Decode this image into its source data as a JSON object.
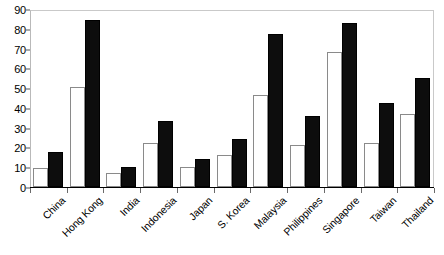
{
  "chart_data": {
    "type": "bar",
    "title": "",
    "subtitle": "",
    "xlabel": "",
    "ylabel": "",
    "ylim": [
      0,
      90
    ],
    "ytick_step": 10,
    "yticks": [
      0,
      10,
      20,
      30,
      40,
      50,
      60,
      70,
      80,
      90
    ],
    "ytick_labels": [
      "0",
      "10",
      "20",
      "30",
      "40",
      "50",
      "60",
      "70",
      "80",
      "90"
    ],
    "grid": false,
    "legend": "none",
    "legend_entries": [],
    "categories": [
      "China",
      "Hong Kong",
      "India",
      "Indonesia",
      "Japan",
      "S. Korea",
      "Malaysia",
      "Philippines",
      "Singapore",
      "Taiwan",
      "Thailand"
    ],
    "series": [
      {
        "name": "series-1",
        "fill": "white",
        "color": "#ffffff",
        "edge_color": "#8a8a8a",
        "values": [
          9.5,
          50.5,
          7.2,
          22.5,
          10.0,
          16.2,
          46.3,
          21.0,
          68.3,
          22.5,
          36.7
        ]
      },
      {
        "name": "series-2",
        "fill": "black",
        "color": "#0d0d0d",
        "edge_color": "#000000",
        "values": [
          17.7,
          84.2,
          10.0,
          33.5,
          14.3,
          24.3,
          77.5,
          35.7,
          83.0,
          42.7,
          55.0
        ]
      }
    ]
  },
  "axes": {
    "frame_color": "#bdbdbd",
    "baseline_color": "#000000",
    "tick_color": "#6a6a6a"
  }
}
